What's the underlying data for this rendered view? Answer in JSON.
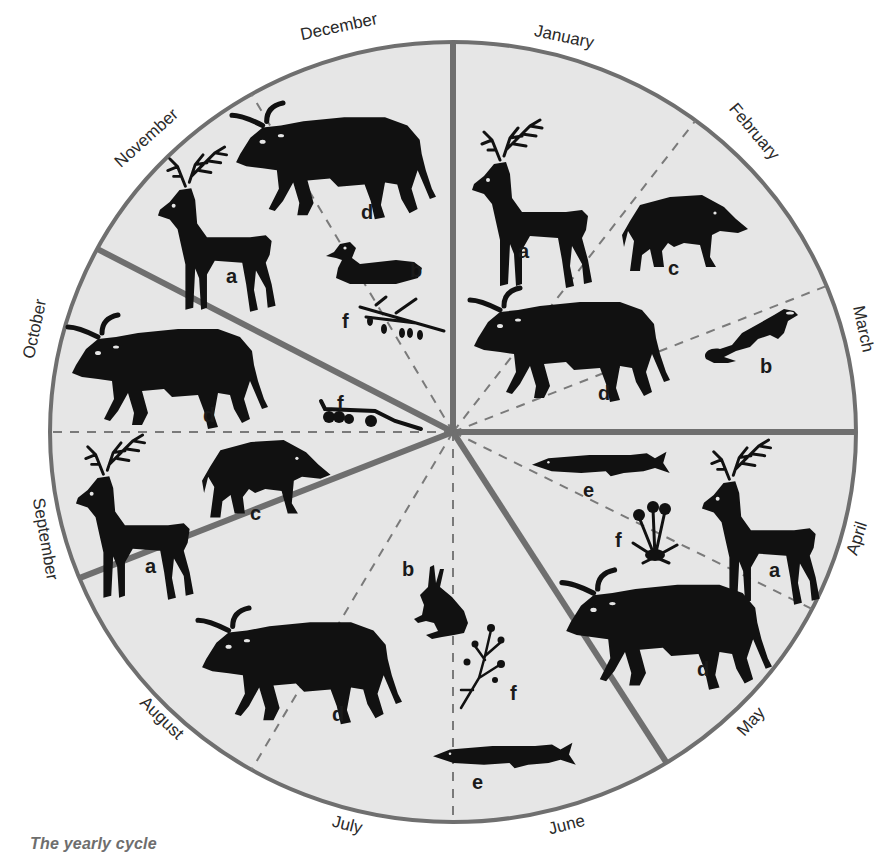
{
  "caption": "The yearly cycle",
  "colors": {
    "disc_fill": "#e6e6e6",
    "outline": "#6f6f6f",
    "season_divider": "#6f6f6f",
    "month_divider": "#7a7a7a",
    "silhouette": "#111111",
    "text": "#2a2a2a",
    "caption": "#6e6e6e"
  },
  "wheel": {
    "center": [
      453,
      432
    ],
    "radius_x": 403,
    "radius_y": 390,
    "solid_dividers_deg": [
      0,
      90,
      148,
      248,
      298
    ],
    "dashed_dividers_deg": [
      37,
      68,
      117,
      180,
      210,
      270,
      330
    ]
  },
  "months": [
    {
      "name": "January",
      "x": 563,
      "y": 42,
      "rot": 12
    },
    {
      "name": "February",
      "x": 750,
      "y": 135,
      "rot": 50
    },
    {
      "name": "March",
      "x": 858,
      "y": 330,
      "rot": 78
    },
    {
      "name": "April",
      "x": 862,
      "y": 540,
      "rot": -72
    },
    {
      "name": "May",
      "x": 755,
      "y": 725,
      "rot": -48
    },
    {
      "name": "June",
      "x": 568,
      "y": 830,
      "rot": -14
    },
    {
      "name": "July",
      "x": 346,
      "y": 830,
      "rot": 14
    },
    {
      "name": "August",
      "x": 158,
      "y": 722,
      "rot": 44
    },
    {
      "name": "September",
      "x": 40,
      "y": 540,
      "rot": 80
    },
    {
      "name": "October",
      "x": 40,
      "y": 330,
      "rot": -78
    },
    {
      "name": "November",
      "x": 150,
      "y": 142,
      "rot": -42
    },
    {
      "name": "December",
      "x": 340,
      "y": 32,
      "rot": -12
    }
  ],
  "legend_keys": {
    "a": "red deer",
    "b": "small animal / bird",
    "c": "wild boar",
    "d": "aurochs",
    "e": "pike",
    "f": "plant"
  },
  "figures": [
    {
      "segment": "January",
      "kind": "deer",
      "letter": "a",
      "x": 470,
      "y": 120,
      "s": 1.0,
      "lx": 518,
      "ly": 258
    },
    {
      "segment": "February",
      "kind": "boar",
      "letter": "c",
      "x": 620,
      "y": 195,
      "s": 1.0,
      "lx": 668,
      "ly": 275
    },
    {
      "segment": "March",
      "kind": "otter",
      "letter": "b",
      "x": 700,
      "y": 305,
      "s": 1.0,
      "lx": 760,
      "ly": 373
    },
    {
      "segment": "January",
      "kind": "bull",
      "letter": "d",
      "x": 470,
      "y": 288,
      "s": 1.0,
      "lx": 598,
      "ly": 400
    },
    {
      "segment": "April",
      "kind": "fish",
      "letter": "e",
      "x": 532,
      "y": 450,
      "s": 0.82,
      "lx": 583,
      "ly": 497
    },
    {
      "segment": "April",
      "kind": "plant",
      "letter": "f",
      "x": 625,
      "y": 497,
      "s": 1.0,
      "lx": 615,
      "ly": 547
    },
    {
      "segment": "April",
      "kind": "deer",
      "letter": "a",
      "x": 700,
      "y": 440,
      "s": 0.98,
      "lx": 769,
      "ly": 577
    },
    {
      "segment": "May",
      "kind": "bull",
      "letter": "d",
      "x": 562,
      "y": 570,
      "s": 1.05,
      "lx": 697,
      "ly": 676
    },
    {
      "segment": "June",
      "kind": "fish",
      "letter": "e",
      "x": 433,
      "y": 741,
      "s": 0.85,
      "lx": 472,
      "ly": 789
    },
    {
      "segment": "June",
      "kind": "twig",
      "letter": "f",
      "x": 455,
      "y": 620,
      "s": 1.0,
      "lx": 510,
      "ly": 700
    },
    {
      "segment": "July",
      "kind": "hare",
      "letter": "b",
      "x": 412,
      "y": 565,
      "s": 1.0,
      "lx": 402,
      "ly": 576
    },
    {
      "segment": "August",
      "kind": "bull",
      "letter": "d",
      "x": 198,
      "y": 608,
      "s": 1.02,
      "lx": 332,
      "ly": 721
    },
    {
      "segment": "September",
      "kind": "deer",
      "letter": "a",
      "x": 74,
      "y": 435,
      "s": 0.98,
      "lx": 145,
      "ly": 573
    },
    {
      "segment": "September",
      "kind": "boar",
      "letter": "c",
      "x": 200,
      "y": 440,
      "s": 1.02,
      "lx": 250,
      "ly": 520
    },
    {
      "segment": "October",
      "kind": "bull",
      "letter": "d",
      "x": 68,
      "y": 315,
      "s": 1.0,
      "lx": 203,
      "ly": 422
    },
    {
      "segment": "October",
      "kind": "berries",
      "letter": "f",
      "x": 315,
      "y": 395,
      "s": 1.0,
      "lx": 337,
      "ly": 410
    },
    {
      "segment": "November",
      "kind": "deer",
      "letter": "a",
      "x": 156,
      "y": 147,
      "s": 0.98,
      "lx": 226,
      "ly": 283
    },
    {
      "segment": "December",
      "kind": "bull",
      "letter": "d",
      "x": 232,
      "y": 103,
      "s": 1.02,
      "lx": 361,
      "ly": 219
    },
    {
      "segment": "December",
      "kind": "duck",
      "letter": "b",
      "x": 326,
      "y": 242,
      "s": 1.0,
      "lx": 410,
      "ly": 277
    },
    {
      "segment": "December",
      "kind": "branch",
      "letter": "f",
      "x": 356,
      "y": 295,
      "s": 1.0,
      "lx": 342,
      "ly": 328
    }
  ]
}
